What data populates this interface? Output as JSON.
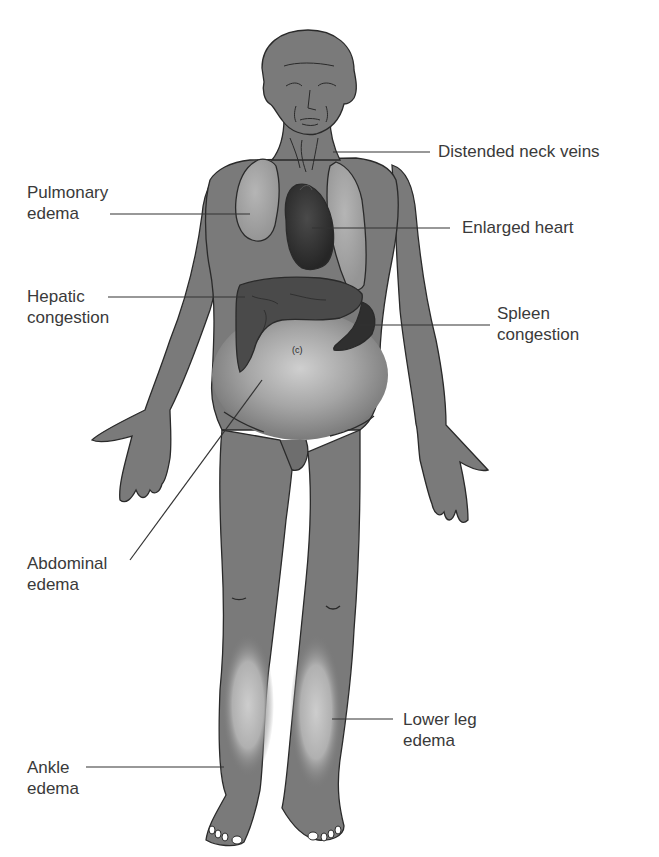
{
  "diagram": {
    "colors": {
      "body": "#7a7a7a",
      "outline": "#2a2a2a",
      "lung": "#a3a3a3",
      "heart": "#3a3a3a",
      "liver": "#4a4a4a",
      "spleen": "#2f2f2f",
      "edema_glow": "#c8c8c8",
      "label_text": "#3a3a3a",
      "leader_line": "#333333",
      "background": "#ffffff"
    },
    "labels": [
      {
        "id": "distended-neck-veins",
        "lines": [
          "Distended neck veins"
        ],
        "side": "right"
      },
      {
        "id": "pulmonary-edema",
        "lines": [
          "Pulmonary",
          "edema"
        ],
        "side": "left"
      },
      {
        "id": "enlarged-heart",
        "lines": [
          "Enlarged heart"
        ],
        "side": "right"
      },
      {
        "id": "hepatic-congestion",
        "lines": [
          "Hepatic",
          "congestion"
        ],
        "side": "left"
      },
      {
        "id": "spleen-congestion",
        "lines": [
          "Spleen",
          "congestion"
        ],
        "side": "right"
      },
      {
        "id": "abdominal-edema",
        "lines": [
          "Abdominal",
          "edema"
        ],
        "side": "left"
      },
      {
        "id": "lower-leg-edema",
        "lines": [
          "Lower leg",
          "edema"
        ],
        "side": "right"
      },
      {
        "id": "ankle-edema",
        "lines": [
          "Ankle",
          "edema"
        ],
        "side": "left"
      }
    ],
    "umbilicus_mark": "(c)"
  }
}
